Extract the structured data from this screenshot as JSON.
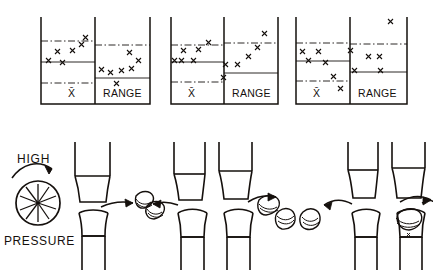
{
  "figure": {
    "ink_color": "#15100d",
    "background_color": "#ffffff"
  },
  "control_charts": {
    "panel_count": 3,
    "axis_labels": {
      "xbar": "X̄",
      "range": "RANGE"
    },
    "panels": [
      {
        "id": "panel-1",
        "state": "in-control",
        "xbar": {
          "label": "X̄",
          "upper_limit_style": "dash-dot",
          "center_line_style": "solid",
          "lower_limit_style": "dash-dot",
          "points": [
            {
              "x": 6,
              "y": 47
            },
            {
              "x": 18,
              "y": 48
            },
            {
              "x": 30,
              "y": 58
            },
            {
              "x": 42,
              "y": 62
            },
            {
              "x": 53,
              "y": 72
            },
            {
              "x": 64,
              "y": 78
            },
            {
              "x": 78,
              "y": 86
            },
            {
              "x": 88,
              "y": 90
            }
          ]
        },
        "range": {
          "label": "RANGE",
          "upper_limit_style": "dash-dot",
          "center_line_style": "solid",
          "points": [
            {
              "x": 8,
              "y": 22
            },
            {
              "x": 22,
              "y": 20
            },
            {
              "x": 36,
              "y": 24
            },
            {
              "x": 48,
              "y": 22
            },
            {
              "x": 58,
              "y": 14
            },
            {
              "x": 68,
              "y": 34
            },
            {
              "x": 80,
              "y": 44
            },
            {
              "x": 90,
              "y": 56
            }
          ]
        }
      },
      {
        "id": "panel-2",
        "state": "range-trending-up",
        "xbar": {
          "label": "X̄",
          "upper_limit_style": "dash-dot",
          "center_line_style": "solid",
          "lower_limit_style": "dash-dot",
          "points": [
            {
              "x": 6,
              "y": 62
            },
            {
              "x": 14,
              "y": 63
            },
            {
              "x": 30,
              "y": 62
            },
            {
              "x": 44,
              "y": 50
            },
            {
              "x": 60,
              "y": 48
            },
            {
              "x": 76,
              "y": 43
            },
            {
              "x": 88,
              "y": 40
            }
          ]
        },
        "range": {
          "label": "RANGE",
          "upper_limit_style": "dash-dot",
          "center_line_style": "solid",
          "points": [
            {
              "x": 4,
              "y": 70
            },
            {
              "x": 22,
              "y": 60
            },
            {
              "x": 36,
              "y": 60
            },
            {
              "x": 54,
              "y": 46
            },
            {
              "x": 66,
              "y": 36
            },
            {
              "x": 78,
              "y": 26
            },
            {
              "x": 90,
              "y": 12
            }
          ]
        }
      },
      {
        "id": "panel-3",
        "state": "xbar-trending-down",
        "xbar": {
          "label": "X̄",
          "upper_limit_style": "dash-dot",
          "center_line_style": "solid",
          "lower_limit_style": "dash-dot",
          "points": [
            {
              "x": 8,
              "y": 40
            },
            {
              "x": 26,
              "y": 40
            },
            {
              "x": 16,
              "y": 54
            },
            {
              "x": 42,
              "y": 58
            },
            {
              "x": 60,
              "y": 74
            },
            {
              "x": 78,
              "y": 86
            }
          ]
        },
        "range": {
          "label": "RANGE",
          "upper_limit_style": "dash-dot",
          "center_line_style": "solid",
          "points": [
            {
              "x": 6,
              "y": 38
            },
            {
              "x": 34,
              "y": 50
            },
            {
              "x": 48,
              "y": 50
            },
            {
              "x": 22,
              "y": 62
            },
            {
              "x": 62,
              "y": 62
            },
            {
              "x": 86,
              "y": 8
            }
          ]
        }
      }
    ]
  },
  "press_diagram": {
    "labels": {
      "high": "HIGH",
      "pressure": "PRESSURE"
    },
    "wheel": {
      "name": "pressure-wheel",
      "spoke_count": 10
    },
    "arrow_curved_label": "high-pressure-arrow",
    "stations": [
      {
        "id": "station-1",
        "punch_set": "single",
        "eject_direction": "right",
        "tablet_count": 1
      },
      {
        "id": "station-2",
        "punch_set": "double",
        "eject_direction": "left-and-right",
        "tablet_count": 3
      },
      {
        "id": "station-3",
        "punch_set": "double",
        "eject_direction": "left-and-right",
        "tablet_count": 2
      }
    ]
  }
}
